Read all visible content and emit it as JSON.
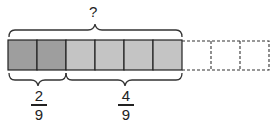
{
  "diagram": {
    "type": "tape-diagram",
    "total_label": "?",
    "total_units": 9,
    "shaded_units": 6,
    "segments": [
      {
        "label_num": "2",
        "label_den": "9",
        "units": 2,
        "color": "#9e9e9e"
      },
      {
        "label_num": "4",
        "label_den": "9",
        "units": 4,
        "color": "#c4c4c4"
      },
      {
        "label": "",
        "units": 3,
        "style": "dashed-empty"
      }
    ]
  }
}
